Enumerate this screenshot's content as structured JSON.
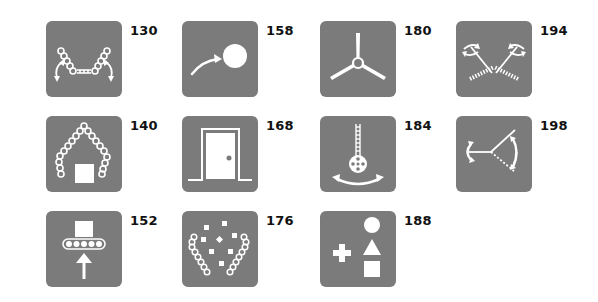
{
  "tile_color": "#7b7b7b",
  "icon_color": "#ffffff",
  "tiles": [
    {
      "number": "130",
      "icon": "two-tilting-conveyor-arms-icon"
    },
    {
      "number": "158",
      "icon": "throw-ball-icon"
    },
    {
      "number": "180",
      "icon": "propeller-icon"
    },
    {
      "number": "194",
      "icon": "rotating-toothed-rods-icon"
    },
    {
      "number": "140",
      "icon": "grabbing-conveyor-arms-icon"
    },
    {
      "number": "168",
      "icon": "door-icon"
    },
    {
      "number": "184",
      "icon": "pendulum-wheel-icon"
    },
    {
      "number": "198",
      "icon": "angle-rotation-joint-icon"
    },
    {
      "number": "152",
      "icon": "push-up-conveyor-icon"
    },
    {
      "number": "176",
      "icon": "pinball-flippers-icon"
    },
    {
      "number": "188",
      "icon": "shapes-add-icon"
    }
  ]
}
